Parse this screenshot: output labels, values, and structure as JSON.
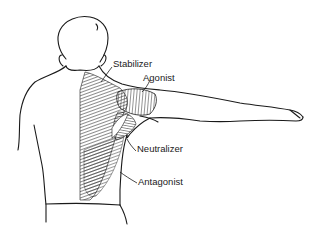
{
  "figure": {
    "labels": [
      {
        "id": "stabilizer",
        "text": "Stabilizer",
        "x": 113,
        "y": 63
      },
      {
        "id": "agonist",
        "text": "Agonist",
        "x": 143,
        "y": 77
      },
      {
        "id": "neutralizer",
        "text": "Neutralizer",
        "x": 137,
        "y": 148
      },
      {
        "id": "antagonist",
        "text": "Antagonist",
        "x": 138,
        "y": 180
      }
    ],
    "colors": {
      "line": "#1a1a1a",
      "background": "#ffffff",
      "muscle_hatch": "#2a2a2a"
    }
  }
}
